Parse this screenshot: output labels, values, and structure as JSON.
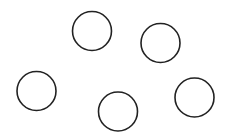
{
  "canvas": {
    "width": 234,
    "height": 136,
    "background": "#ffffff"
  },
  "stroke_color": "#222222",
  "circles": [
    {
      "id": "circle-1",
      "cx": 92,
      "cy": 31,
      "r": 19.5
    },
    {
      "id": "circle-2",
      "cx": 160.5,
      "cy": 43,
      "r": 19.5
    },
    {
      "id": "circle-3",
      "cx": 36.5,
      "cy": 91,
      "r": 19.5
    },
    {
      "id": "circle-4",
      "cx": 118,
      "cy": 111.5,
      "r": 19.5
    },
    {
      "id": "circle-5",
      "cx": 194.5,
      "cy": 97.5,
      "r": 19.5
    }
  ]
}
